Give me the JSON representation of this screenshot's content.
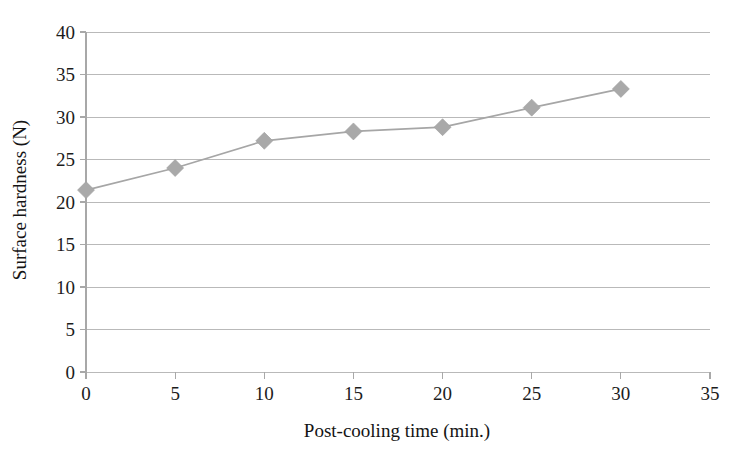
{
  "chart_data": {
    "type": "line",
    "title": "",
    "subtitle": "",
    "xlabel": "Post-cooling time (min.)",
    "ylabel": "Surface hardness (N)",
    "xlim": [
      0,
      35
    ],
    "ylim": [
      0,
      40
    ],
    "xticks": [
      0,
      5,
      10,
      15,
      20,
      25,
      30,
      35
    ],
    "yticks": [
      0,
      5,
      10,
      15,
      20,
      25,
      30,
      35,
      40
    ],
    "xtick_labels": [
      "0",
      "5",
      "10",
      "15",
      "20",
      "25",
      "30",
      "35"
    ],
    "ytick_labels": [
      "0",
      "5",
      "10",
      "15",
      "20",
      "25",
      "30",
      "35",
      "40"
    ],
    "grid": "horizontal",
    "legend": "none",
    "x": [
      0,
      5,
      10,
      15,
      20,
      25,
      30
    ],
    "series": [
      {
        "name": "Surface hardness",
        "values": [
          21.4,
          24.0,
          27.2,
          28.3,
          28.8,
          31.1,
          33.3
        ],
        "marker": "diamond",
        "line_color": "#a6a6a6",
        "marker_color": "#a9a9a9"
      }
    ],
    "colors": {
      "series": "#a6a6a6",
      "marker": "#a9a9a9",
      "grid": "#b9b9b9",
      "axis": "#a8a8a8",
      "text": "#1c1c1c",
      "background": "#ffffff"
    }
  }
}
